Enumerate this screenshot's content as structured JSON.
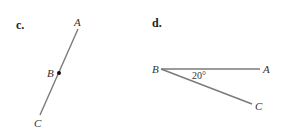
{
  "figure_c": {
    "part_label": "c.",
    "points": {
      "A": {
        "label": "A",
        "x": 78,
        "y": 29
      },
      "B": {
        "label": "B",
        "x": 59,
        "y": 73
      },
      "C": {
        "label": "C",
        "x": 40,
        "y": 115
      }
    }
  },
  "figure_d": {
    "part_label": "d.",
    "points": {
      "B": {
        "label": "B",
        "x": 160,
        "y": 69
      },
      "A": {
        "label": "A",
        "x": 261,
        "y": 69
      },
      "C": {
        "label": "C",
        "x": 253,
        "y": 104
      }
    },
    "angle_label": "20°"
  },
  "colors": {
    "line": "#7a7a7a",
    "text": "#333333",
    "point": "#111111"
  }
}
